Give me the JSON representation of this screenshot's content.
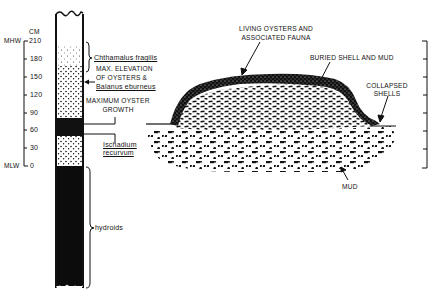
{
  "left_panel": {
    "scale": {
      "unit": "CM",
      "top_marker": "MHW",
      "bottom_marker": "MLW",
      "ticks": [
        "210",
        "180",
        "150",
        "120",
        "90",
        "60",
        "30",
        "0"
      ]
    },
    "zones": [
      {
        "label": "Chthamalus fragilis",
        "italic_underlined": true
      },
      {
        "label_line1": "MAX. ELEVATION",
        "label_line2": "OF OYSTERS &",
        "label_line3": "Balanus eburneus"
      },
      {
        "label_line1": "MAXIMUM OYSTER",
        "label_line2": "GROWTH"
      },
      {
        "label_line1": "Ischadium",
        "label_line2": "recurvum"
      },
      {
        "label": "hydroids"
      }
    ]
  },
  "right_panel": {
    "labels": {
      "living_line1": "LIVING OYSTERS AND",
      "living_line2": "ASSOCIATED FAUNA",
      "buried": "BURIED SHELL AND MUD",
      "collapsed_line1": "COLLAPSED",
      "collapsed_line2": "SHELLS",
      "mud": "MUD"
    },
    "scale_bar_ticks": 8
  },
  "colors": {
    "ink": "#111111",
    "background": "#ffffff"
  }
}
